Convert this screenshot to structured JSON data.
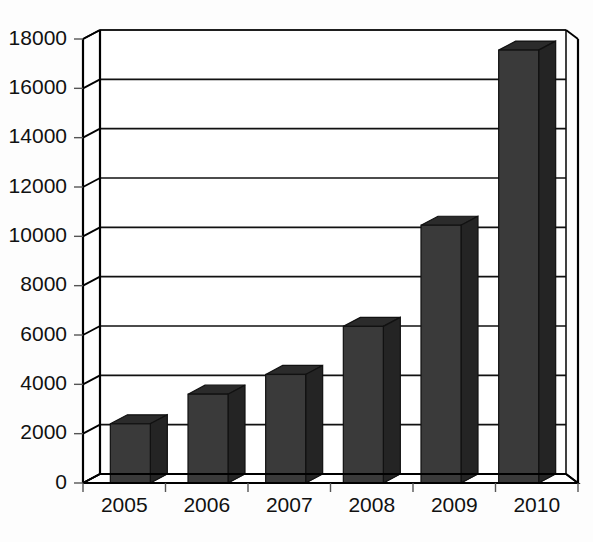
{
  "chart_data": {
    "type": "bar",
    "title": "",
    "subtitle": "",
    "xlabel": "",
    "ylabel": "",
    "categories": [
      "2005",
      "2006",
      "2007",
      "2008",
      "2009",
      "2010"
    ],
    "values": [
      2400,
      3600,
      4400,
      6350,
      10450,
      17550
    ],
    "series": [
      {
        "name": "Series 1",
        "values": [
          2400,
          3600,
          4400,
          6350,
          10450,
          17550
        ]
      }
    ],
    "ylim": [
      0,
      18000
    ],
    "ytick_labels": [
      "0",
      "2000",
      "4000",
      "6000",
      "8000",
      "10000",
      "12000",
      "14000",
      "16000",
      "18000"
    ],
    "ytick_values": [
      0,
      2000,
      4000,
      6000,
      8000,
      10000,
      12000,
      14000,
      16000,
      18000
    ],
    "grid": true,
    "grid_axis": "y",
    "legend": false,
    "legend_position": "none",
    "annotations": [],
    "style": "3d-column",
    "colors": {
      "bar_front": "#3a3a3a",
      "bar_top": "#2b2b2b",
      "bar_side": "#242424",
      "bar_shadow": "#8a8a8a",
      "axis": "#000000",
      "grid": "#111111",
      "text": "#111111",
      "background": "#fdfdfd",
      "plot_background": "#ffffff"
    }
  }
}
